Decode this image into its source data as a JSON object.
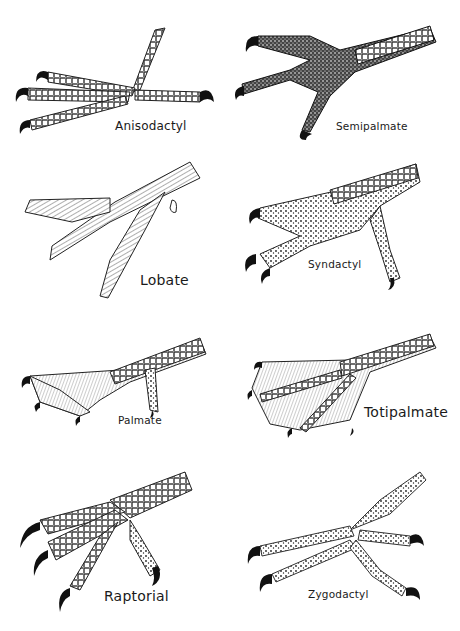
{
  "diagram": {
    "panels": [
      {
        "id": "anisodactyl",
        "label": "Anisodactyl",
        "position": "row1-left"
      },
      {
        "id": "semipalmate",
        "label": "Semipalmate",
        "position": "row1-right"
      },
      {
        "id": "lobate",
        "label": "Lobate",
        "position": "row2-left"
      },
      {
        "id": "syndactyl",
        "label": "Syndactyl",
        "position": "row2-right"
      },
      {
        "id": "palmate",
        "label": "Palmate",
        "position": "row3-left"
      },
      {
        "id": "totipalmate",
        "label": "Totipalmate",
        "position": "row3-right"
      },
      {
        "id": "raptorial",
        "label": "Raptorial",
        "position": "row4-left"
      },
      {
        "id": "zygodactyl",
        "label": "Zygodactyl",
        "position": "row4-right"
      }
    ]
  },
  "colors": {
    "ink": "#1a1a1a",
    "paper": "#ffffff",
    "stipple": "#3a3a3a"
  }
}
